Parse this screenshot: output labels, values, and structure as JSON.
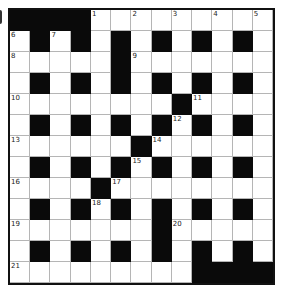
{
  "puzzle": {
    "type": "crossword",
    "rows": 13,
    "cols": 13,
    "layout": [
      "#############",
      "x#x#x#x#x#x#x",
      "xxxxx#xxxxxxx",
      "x#x#x#x#x#x#x",
      "xxxxxxxx#xxxx",
      "x#x#x#x#x#x#x",
      "xxxxxx#xxxxxx",
      "x#x#x#x#x#x#x",
      "xxxx#xxxxxxxx",
      "x#x#x#x#x#x#x",
      "xxxxxxx#xxxxx",
      "x#x#x#x#x#x#x",
      "xxxxxxxxx####"
    ],
    "grid": [
      [
        "#",
        "#",
        "#",
        "#",
        "1",
        "",
        "2",
        "",
        "3",
        "",
        "4",
        "",
        "5"
      ],
      [
        "6",
        "#",
        "7",
        "#",
        "",
        "#",
        "",
        "#",
        "",
        "#",
        "",
        "#",
        ""
      ],
      [
        "8",
        "",
        "",
        "",
        "",
        "#",
        "9",
        "",
        "",
        "",
        "",
        "",
        ""
      ],
      [
        "",
        "#",
        "",
        "#",
        "",
        "#",
        "",
        "#",
        "",
        "#",
        "",
        "#",
        ""
      ],
      [
        "10",
        "",
        "",
        "",
        "",
        "",
        "",
        "",
        "#",
        "11",
        "",
        "",
        ""
      ],
      [
        "",
        "#",
        "",
        "#",
        "",
        "#",
        "",
        "#",
        "12",
        "#",
        "",
        "#",
        ""
      ],
      [
        "13",
        "",
        "",
        "",
        "",
        "",
        "#",
        "14",
        "",
        "",
        "",
        "",
        ""
      ],
      [
        "",
        "#",
        "",
        "#",
        "",
        "#",
        "15",
        "#",
        "",
        "#",
        "",
        "#",
        ""
      ],
      [
        "16",
        "",
        "",
        "",
        "#",
        "17",
        "",
        "",
        "",
        "",
        "",
        "",
        ""
      ],
      [
        "",
        "#",
        "",
        "#",
        "18",
        "#",
        "",
        "#",
        "",
        "#",
        "",
        "#",
        ""
      ],
      [
        "19",
        "",
        "",
        "",
        "",
        "",
        "",
        "#",
        "20",
        "",
        "",
        "",
        ""
      ],
      [
        "",
        "#",
        "",
        "#",
        "",
        "#",
        "",
        "#",
        "",
        "#",
        "",
        "#",
        ""
      ],
      [
        "21",
        "",
        "",
        "",
        "",
        "",
        "",
        "",
        "",
        "#",
        "#",
        "#",
        "#"
      ]
    ],
    "clue_numbers": [
      "1",
      "2",
      "3",
      "4",
      "5",
      "6",
      "7",
      "8",
      "9",
      "10",
      "11",
      "12",
      "13",
      "14",
      "15",
      "16",
      "17",
      "18",
      "19",
      "20",
      "21"
    ]
  },
  "colors": {
    "block": "#0a0a0a",
    "cell": "#ffffff",
    "gridline": "#b5b5b5",
    "border": "#111111"
  }
}
